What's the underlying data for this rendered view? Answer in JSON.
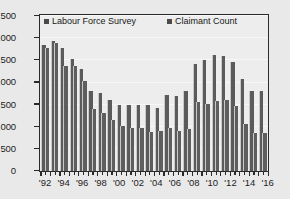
{
  "chart_data": {
    "type": "bar",
    "title": "",
    "subtitle": "",
    "xlabel": "",
    "ylabel": "",
    "ylim": [
      0,
      3500
    ],
    "ytick_values": [
      0,
      500,
      1000,
      1500,
      2000,
      2500,
      3000,
      3500
    ],
    "ytick_labels": [
      "0",
      "500",
      "1,000",
      "1,500",
      "2,000",
      "2,500",
      "3,000",
      "3,500"
    ],
    "grid": true,
    "grid_axis": "y",
    "legend_position": "top-inside",
    "bar_color": "#5b5b5b",
    "plot_background": "#ededed",
    "page_background": "#e9e9e9",
    "axis_color": "#2a2a2a",
    "x": [
      "1992",
      "1993",
      "1994",
      "1995",
      "1996",
      "1997",
      "1998",
      "1999",
      "2000",
      "2001",
      "2002",
      "2003",
      "2004",
      "2005",
      "2006",
      "2007",
      "2008",
      "2009",
      "2010",
      "2011",
      "2012",
      "2013",
      "2014",
      "2015"
    ],
    "xtick_labels": [
      "'92",
      "'94",
      "'96",
      "'98",
      "'00",
      "'02",
      "'04",
      "'06",
      "'08",
      "'10",
      "'12",
      "'14",
      "'16"
    ],
    "xtick_years": [
      1992,
      1994,
      1996,
      1998,
      2000,
      2002,
      2004,
      2006,
      2008,
      2010,
      2012,
      2014,
      2016
    ],
    "x_axis_start": 1991.5,
    "x_axis_end": 2016.0,
    "series": [
      {
        "name": "Labour Force Survey",
        "color": "#5b5b5b",
        "values": [
          2840,
          2940,
          2780,
          2530,
          2290,
          1810,
          1760,
          1610,
          1500,
          1500,
          1490,
          1500,
          1430,
          1710,
          1690,
          1800,
          2420,
          2500,
          2620,
          2600,
          2460,
          2070,
          1800,
          1800
        ]
      },
      {
        "name": "Claimant Count",
        "color": "#5e5e5e",
        "values": [
          2770,
          2880,
          2360,
          2370,
          2020,
          1390,
          1310,
          1150,
          1010,
          980,
          960,
          890,
          900,
          980,
          900,
          940,
          1560,
          1520,
          1570,
          1610,
          1460,
          1070,
          860,
          860
        ]
      }
    ]
  },
  "legend": {
    "items": [
      {
        "label": "Labour Force Survey"
      },
      {
        "label": "Claimant Count"
      }
    ]
  }
}
